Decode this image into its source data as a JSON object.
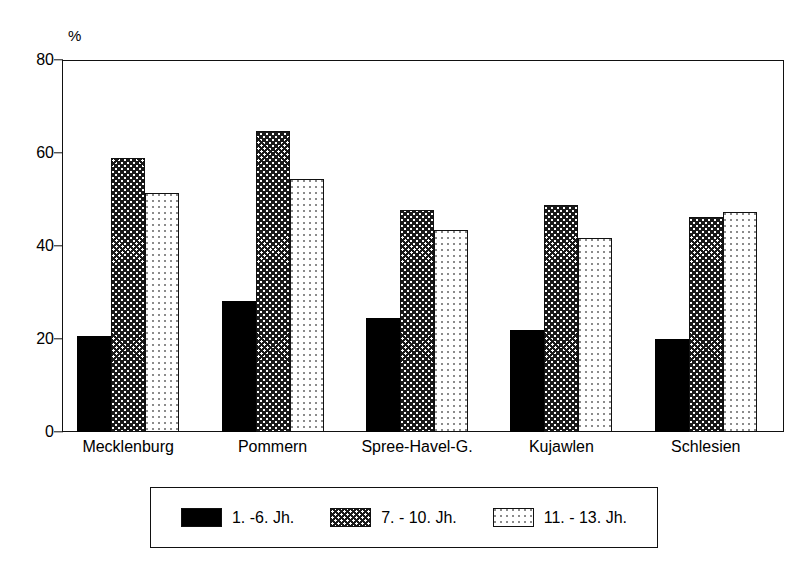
{
  "chart_data": {
    "type": "bar",
    "title": "",
    "xlabel": "",
    "ylabel": "%",
    "unit_label": "%",
    "ylim": [
      0,
      80
    ],
    "ytick_values": [
      0,
      20,
      40,
      60,
      80
    ],
    "ytick_labels": [
      "0",
      "20",
      "40",
      "60",
      "80"
    ],
    "grid": false,
    "legend_position": "bottom",
    "categories": [
      "Mecklenburg",
      "Pommern",
      "Spree-Havel-G.",
      "Kujawlen",
      "Schlesien"
    ],
    "series": [
      {
        "name": "1. -6. Jh.",
        "pattern": "solid-black",
        "values": [
          20.7,
          28.2,
          24.6,
          21.9,
          20.1
        ]
      },
      {
        "name": "7. - 10. Jh.",
        "pattern": "checkered",
        "values": [
          58.9,
          64.7,
          47.8,
          48.9,
          46.2
        ]
      },
      {
        "name": "11. - 13. Jh.",
        "pattern": "dotted",
        "values": [
          51.3,
          54.5,
          43.4,
          41.7,
          47.3
        ]
      }
    ]
  },
  "colors": {
    "axis": "#111111",
    "solid_fill": "#000000",
    "check_fill": "#1a1a1a",
    "dot_fill": "#444444",
    "background": "#ffffff"
  }
}
